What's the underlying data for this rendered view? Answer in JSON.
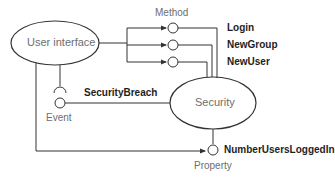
{
  "diagram": {
    "nodes": {
      "user_interface": {
        "label": "User interface"
      },
      "security": {
        "label": "Security"
      }
    },
    "categories": {
      "method": "Method",
      "event": "Event",
      "property": "Property"
    },
    "methods": [
      {
        "label": "Login"
      },
      {
        "label": "NewGroup"
      },
      {
        "label": "NewUser"
      }
    ],
    "event": {
      "label": "SecurityBreach"
    },
    "property": {
      "label": "NumberUsersLoggedIn"
    },
    "colors": {
      "line": "#333333",
      "category_text": "#6e6e6e",
      "member_text": "#1e1e1e",
      "background": "#ffffff"
    }
  }
}
